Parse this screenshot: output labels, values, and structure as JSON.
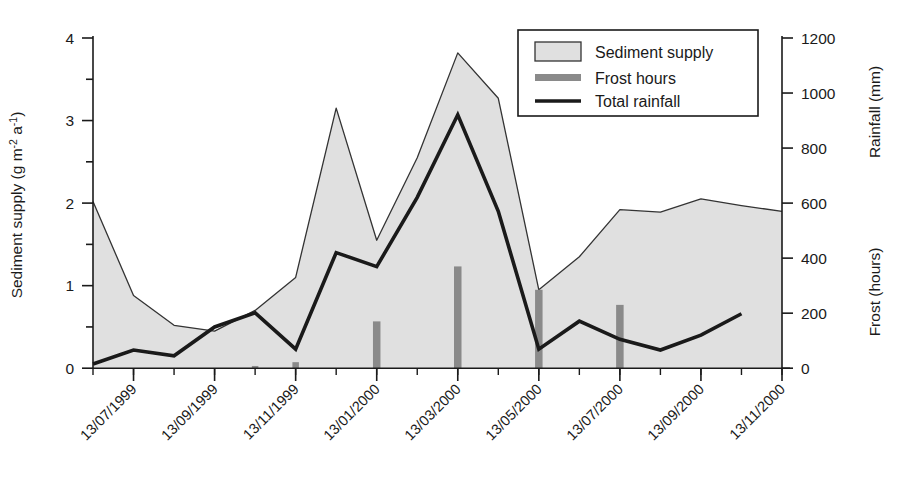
{
  "figure": {
    "background": "#ffffff",
    "ink": "#1a1a1a"
  },
  "axes": {
    "left": {
      "title_main": "Sediment supply (g m",
      "title_sup1": "-2",
      "title_mid": " a",
      "title_sup2": "-1",
      "title_end": ")",
      "title_plain": "Sediment supply (g m-2 a-1)",
      "ticks": [
        "0",
        "1",
        "2",
        "3",
        "4"
      ],
      "min": 0,
      "max": 4,
      "minor_step": 0.5
    },
    "right": {
      "title_upper": "Rainfall (mm)",
      "title_lower": "Frost (hours)",
      "ticks": [
        "0",
        "200",
        "400",
        "600",
        "800",
        "1000",
        "1200"
      ],
      "min": 0,
      "max": 1200
    },
    "bottom": {
      "ticks": [
        "13/07/1999",
        "13/09/1999",
        "13/11/1999",
        "13/01/2000",
        "13/03/2000",
        "13/05/2000",
        "13/07/2000",
        "13/09/2000",
        "13/11/2000"
      ],
      "rotation_deg": -45
    }
  },
  "legend": {
    "items": [
      {
        "label": "Sediment supply",
        "marker": "area-swatch",
        "color": "#e0e0e0",
        "edge": "#333333"
      },
      {
        "label": "Frost hours",
        "marker": "bar-swatch",
        "color": "#8a8a8a"
      },
      {
        "label": "Total rainfall",
        "marker": "line-swatch",
        "color": "#1a1a1a"
      }
    ],
    "border_color": "#1a1a1a"
  },
  "chart_data": {
    "type": "area",
    "title": "",
    "xlabel": "",
    "ylabel": "Sediment supply (g m-2 a-1)",
    "ylabel_right": "Rainfall (mm) / Frost (hours)",
    "ylim": [
      0,
      4
    ],
    "ylim_right": [
      0,
      1200
    ],
    "grid": false,
    "legend_position": "top-right",
    "x": [
      "13/06/1999",
      "13/07/1999",
      "13/08/1999",
      "13/09/1999",
      "13/10/1999",
      "13/11/1999",
      "13/12/1999",
      "13/01/2000",
      "13/02/2000",
      "13/03/2000",
      "13/04/2000",
      "13/05/2000",
      "13/06/2000",
      "13/07/2000",
      "13/08/2000",
      "13/09/2000",
      "13/10/2000",
      "13/11/2000"
    ],
    "series": [
      {
        "name": "Sediment supply",
        "type": "area",
        "axis": "left",
        "unit": "g m-2 a-1",
        "color": "#e0e0e0",
        "edge": "#333333",
        "values": [
          2.02,
          0.88,
          0.52,
          0.45,
          0.7,
          1.1,
          3.15,
          1.55,
          2.55,
          3.82,
          3.27,
          0.95,
          1.35,
          1.92,
          1.89,
          2.05,
          1.97,
          1.9
        ]
      },
      {
        "name": "Total rainfall",
        "type": "line",
        "axis": "right",
        "unit": "mm",
        "color": "#1a1a1a",
        "values": [
          15,
          65,
          45,
          150,
          200,
          70,
          420,
          370,
          620,
          920,
          570,
          70,
          170,
          105,
          65,
          120,
          200,
          null
        ],
        "values_left_scale": [
          0.05,
          0.22,
          0.15,
          0.5,
          0.67,
          0.23,
          1.4,
          1.23,
          2.07,
          3.07,
          1.9,
          0.23,
          0.57,
          0.35,
          0.22,
          0.4,
          0.66,
          null
        ]
      },
      {
        "name": "Frost hours",
        "type": "bar",
        "axis": "right",
        "unit": "hours",
        "color": "#8a8a8a",
        "values": [
          0,
          0,
          0,
          0,
          8,
          22,
          0,
          170,
          0,
          370,
          0,
          285,
          0,
          230,
          0,
          0,
          0,
          0
        ],
        "values_left_scale": [
          0,
          0,
          0,
          0,
          0.027,
          0.073,
          0,
          0.567,
          0,
          1.233,
          0,
          0.95,
          0,
          0.767,
          0,
          0,
          0,
          0
        ]
      }
    ]
  }
}
